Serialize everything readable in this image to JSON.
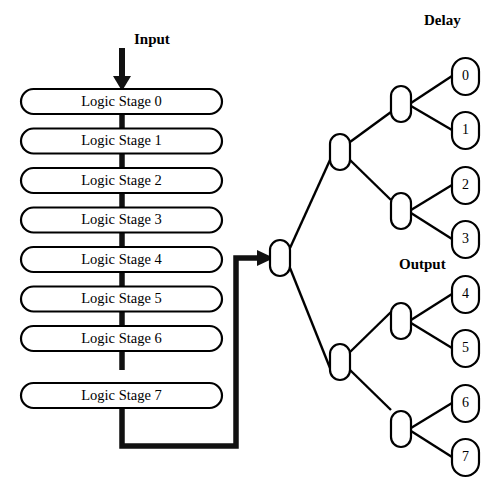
{
  "diagram": {
    "background_color": "#ffffff",
    "line_color": "#000000",
    "bus_color": "#111111"
  },
  "annotations": {
    "input_label": "Input",
    "delay_label": "Delay",
    "output_label": "Output"
  },
  "pipeline": {
    "stages": [
      {
        "label": "Logic Stage 0"
      },
      {
        "label": "Logic Stage 1"
      },
      {
        "label": "Logic Stage 2"
      },
      {
        "label": "Logic Stage 3"
      },
      {
        "label": "Logic Stage 4"
      },
      {
        "label": "Logic Stage 5"
      },
      {
        "label": "Logic Stage 6"
      },
      {
        "label": "Logic Stage 7"
      }
    ]
  },
  "tree": {
    "root": {
      "label": ""
    },
    "level2": [
      {
        "label": ""
      },
      {
        "label": ""
      }
    ],
    "level3": [
      {
        "label": ""
      },
      {
        "label": ""
      },
      {
        "label": ""
      },
      {
        "label": ""
      }
    ],
    "leaves": [
      {
        "label": "0"
      },
      {
        "label": "1"
      },
      {
        "label": "2"
      },
      {
        "label": "3"
      },
      {
        "label": "4"
      },
      {
        "label": "5"
      },
      {
        "label": "6"
      },
      {
        "label": "7"
      }
    ]
  }
}
